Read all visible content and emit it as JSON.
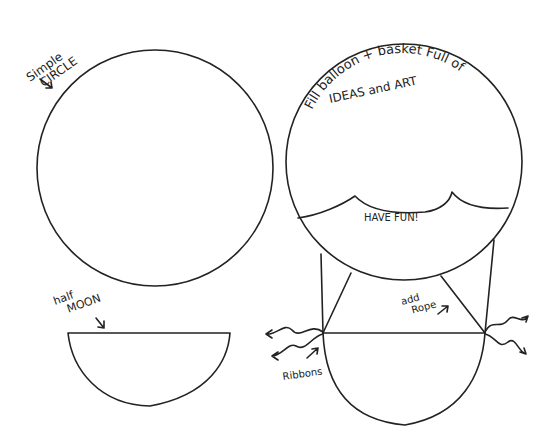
{
  "diagram": {
    "labels": {
      "simple_circle_line1": "Simple",
      "simple_circle_line2": "CIRCLE",
      "balloon_text_line1": "Fill balloon + basket Full of",
      "balloon_text_line2": "IDEAS and ART",
      "have_fun": "HAVE FUN!",
      "half_moon_line1": "half",
      "half_moon_line2": "MOON",
      "add_rope_line1": "add",
      "add_rope_line2": "Rope",
      "ribbons": "Ribbons"
    },
    "shapes": {
      "simple_circle": {
        "cx": 155,
        "cy": 168,
        "r": 118
      },
      "balloon_circle": {
        "cx": 404,
        "cy": 162,
        "r": 118
      },
      "half_moon": {
        "x1": 68,
        "x2": 230,
        "top": 333,
        "bottom": 406
      },
      "basket": {
        "x1": 323,
        "x2": 485,
        "top": 333,
        "bottom": 425
      }
    },
    "colors": {
      "ink": "#222222",
      "paper": "#ffffff"
    }
  }
}
